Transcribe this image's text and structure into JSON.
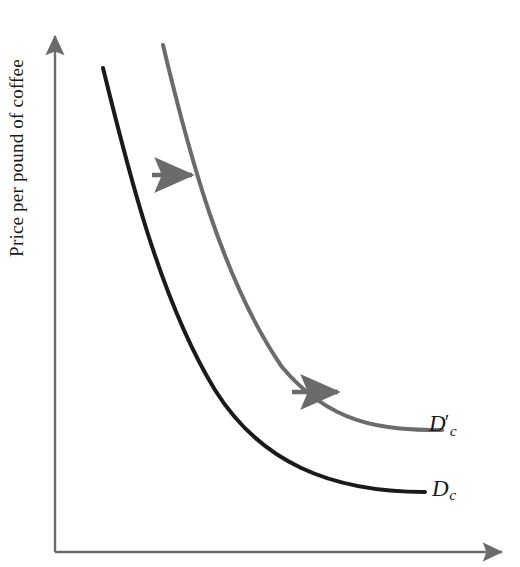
{
  "figure": {
    "type": "economics-demand-curve-diagram",
    "width": 520,
    "height": 567,
    "background_color": "#ffffff"
  },
  "axes": {
    "y": {
      "label": "Price per pound of coffee",
      "color": "#6b6b6b",
      "has_arrowhead": true,
      "arrow_direction": "up",
      "x_px": 55,
      "top_px": 30,
      "bottom_px": 552
    },
    "x": {
      "label": "",
      "color": "#6b6b6b",
      "has_arrowhead": true,
      "arrow_direction": "right",
      "y_px": 552,
      "left_px": 55,
      "right_px": 508
    }
  },
  "curves": [
    {
      "id": "dc",
      "label": "D",
      "subscript": "c",
      "prime": "",
      "color": "#1a1a1a",
      "stroke_width": 4,
      "description": "original demand curve for coffee, convex to origin",
      "path": "M 103 68 C 128 170, 160 300, 215 390 C 260 462, 330 492, 425 492"
    },
    {
      "id": "dc-prime",
      "label": "D",
      "subscript": "c",
      "prime": "′",
      "color": "#6b6b6b",
      "stroke_width": 4,
      "description": "new demand curve after rightward shift (increase in demand)",
      "path": "M 163 45 C 188 150, 222 280, 282 367 C 330 424, 380 430, 442 430"
    }
  ],
  "shift_arrows": [
    {
      "id": "shift-arrow-upper",
      "color": "#6b6b6b",
      "direction": "right",
      "x1": 152,
      "y1": 175,
      "x2": 197,
      "y2": 175
    },
    {
      "id": "shift-arrow-lower",
      "color": "#6b6b6b",
      "direction": "right",
      "x1": 292,
      "y1": 392,
      "x2": 343,
      "y2": 392
    }
  ],
  "chart_data": {
    "type": "line",
    "title": "",
    "xlabel": "",
    "ylabel": "Price per pound of coffee",
    "grid": false,
    "legend": "inline-curve-labels",
    "annotations": [
      "rightward shift arrow (upper)",
      "rightward shift arrow (lower)"
    ],
    "series": [
      {
        "name": "D_c",
        "label": "Dc",
        "color": "#1a1a1a",
        "points": [
          [
            103,
            68
          ],
          [
            120,
            130
          ],
          [
            140,
            200
          ],
          [
            165,
            268
          ],
          [
            196,
            348
          ],
          [
            232,
            416
          ],
          [
            280,
            462
          ],
          [
            340,
            483
          ],
          [
            425,
            492
          ]
        ]
      },
      {
        "name": "D_c_prime",
        "label": "D'c",
        "color": "#6b6b6b",
        "points": [
          [
            163,
            45
          ],
          [
            180,
            110
          ],
          [
            200,
            180
          ],
          [
            226,
            248
          ],
          [
            258,
            322
          ],
          [
            296,
            382
          ],
          [
            344,
            416
          ],
          [
            396,
            428
          ],
          [
            442,
            430
          ]
        ]
      }
    ]
  }
}
